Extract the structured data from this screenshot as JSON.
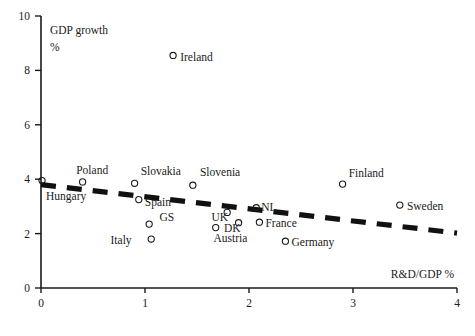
{
  "chart_data": {
    "type": "scatter",
    "title": "",
    "xlabel": "R&D/GDP %",
    "ylabel": "GDP growth %",
    "ylabel_line1": "GDP growth",
    "ylabel_line2": "%",
    "xlim": [
      0,
      4
    ],
    "ylim": [
      0,
      10
    ],
    "xticks": [
      "0",
      "1",
      "2",
      "3",
      "4"
    ],
    "xtick_values": [
      0,
      1,
      2,
      3,
      4
    ],
    "yticks": [
      "0",
      "2",
      "4",
      "6",
      "8",
      "10"
    ],
    "ytick_values": [
      0,
      2,
      4,
      6,
      8,
      10
    ],
    "grid": false,
    "legend": "none",
    "marker_style": "open-circle",
    "points": [
      {
        "label": "Ireland",
        "x": 1.27,
        "y": 8.55,
        "lx": 1.3,
        "ly": 8.5,
        "anchor": "start"
      },
      {
        "label": "Hungary",
        "x": 0.01,
        "y": 3.95,
        "lx": 0.01,
        "ly": 3.38,
        "anchor": "start"
      },
      {
        "label": "Poland",
        "x": 0.4,
        "y": 3.9,
        "lx": 0.3,
        "ly": 4.35,
        "anchor": "start"
      },
      {
        "label": "Slovakia",
        "x": 0.9,
        "y": 3.85,
        "lx": 0.92,
        "ly": 4.3,
        "anchor": "start"
      },
      {
        "label": "Spain",
        "x": 0.94,
        "y": 3.25,
        "lx": 0.96,
        "ly": 3.15,
        "anchor": "start"
      },
      {
        "label": "Slovenia",
        "x": 1.46,
        "y": 3.78,
        "lx": 1.49,
        "ly": 4.25,
        "anchor": "start"
      },
      {
        "label": "GS",
        "x": 1.04,
        "y": 2.35,
        "lx": 1.1,
        "ly": 2.6,
        "anchor": "start"
      },
      {
        "label": "Italy",
        "x": 1.06,
        "y": 1.8,
        "lx": 0.63,
        "ly": 1.78,
        "anchor": "start"
      },
      {
        "label": "UK",
        "x": 1.79,
        "y": 2.78,
        "lx": 1.6,
        "ly": 2.6,
        "anchor": "start"
      },
      {
        "label": "DK",
        "x": 1.9,
        "y": 2.4,
        "lx": 1.72,
        "ly": 2.2,
        "anchor": "start"
      },
      {
        "label": "Austria",
        "x": 1.68,
        "y": 2.22,
        "lx": 1.62,
        "ly": 1.82,
        "anchor": "start"
      },
      {
        "label": "NL",
        "x": 2.07,
        "y": 2.95,
        "lx": 2.08,
        "ly": 2.98,
        "anchor": "start"
      },
      {
        "label": "France",
        "x": 2.1,
        "y": 2.42,
        "lx": 2.12,
        "ly": 2.38,
        "anchor": "start"
      },
      {
        "label": "Germany",
        "x": 2.35,
        "y": 1.72,
        "lx": 2.37,
        "ly": 1.68,
        "anchor": "start"
      },
      {
        "label": "Finland",
        "x": 2.9,
        "y": 3.82,
        "lx": 2.92,
        "ly": 4.22,
        "anchor": "start"
      },
      {
        "label": "Sweden",
        "x": 3.45,
        "y": 3.05,
        "lx": 3.48,
        "ly": 3.02,
        "anchor": "start"
      }
    ],
    "trendline": {
      "style": "dashed",
      "x_start": 0.0,
      "y_start": 3.8,
      "x_end": 4.0,
      "y_end": 2.02
    }
  },
  "colors": {
    "ink": "#1a1a1a",
    "background": "#ffffff",
    "trend": "#111111"
  }
}
